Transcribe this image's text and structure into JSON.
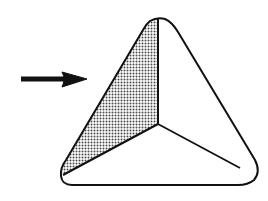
{
  "diagram": {
    "colors": {
      "background": "#ffffff",
      "stroke": "#111111",
      "shade": "#8a8a8a"
    },
    "shapes": {
      "outline": "M150 21 Q157 17 165 19 Q172 22 178 32 L255 160 Q261 172 254 180 Q248 185 238 185 L72 185 Q62 185 61 176 Q60 168 66 160 L143 30 Q146 24 150 21 Z",
      "shaded_face": "M158 18 L158 124 L63 175 Q60 168 66 160 L143 30 Q148 21 158 18 Z",
      "edge_vertical": "M158 18 L158 124",
      "edge_left": "M158 124 L63 175",
      "edge_right": "M158 124 L240 168"
    },
    "arrow": {
      "direction": "right",
      "shaft": "M21 79 L68 79",
      "head": "M62 72 L87 79 L62 87 Q66 79 62 72 Z"
    }
  }
}
